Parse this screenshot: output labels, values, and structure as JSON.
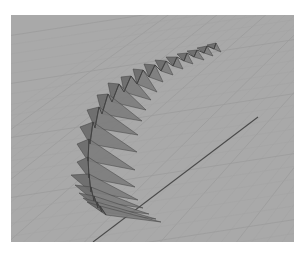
{
  "viewport": {
    "name": "perspective-viewport",
    "background": "#a9a9a9",
    "grid_color": "#9c9c9c",
    "grid_minor_color": "#a2a2a2",
    "axis_color": "#4a4a4a",
    "panel_left_fill": "#6b6b6b",
    "panel_right_fill": "#7c7c7c",
    "panel_edge": "#404040"
  },
  "axis_line": {
    "x1": 247,
    "y1": 102,
    "x2": 82,
    "y2": 227
  },
  "panels": [
    {
      "spine_top": [
        205,
        28
      ],
      "spine_bot": [
        203,
        34
      ],
      "left": [
        196,
        30
      ],
      "right": [
        210,
        37
      ]
    },
    {
      "spine_top": [
        196,
        31
      ],
      "spine_bot": [
        193,
        38
      ],
      "left": [
        186,
        33
      ],
      "right": [
        202,
        41
      ]
    },
    {
      "spine_top": [
        186,
        35
      ],
      "spine_bot": [
        183,
        42
      ],
      "left": [
        176,
        36
      ],
      "right": [
        193,
        45
      ]
    },
    {
      "spine_top": [
        176,
        38
      ],
      "spine_bot": [
        173,
        46
      ],
      "left": [
        166,
        39
      ],
      "right": [
        182,
        49
      ]
    },
    {
      "spine_top": [
        166,
        42
      ],
      "spine_bot": [
        162,
        51
      ],
      "left": [
        155,
        42
      ],
      "right": [
        172,
        54
      ]
    },
    {
      "spine_top": [
        155,
        46
      ],
      "spine_bot": [
        150,
        56
      ],
      "left": [
        144,
        45
      ],
      "right": [
        162,
        60
      ]
    },
    {
      "spine_top": [
        144,
        50
      ],
      "spine_bot": [
        138,
        62
      ],
      "left": [
        133,
        49
      ],
      "right": [
        152,
        67
      ]
    },
    {
      "spine_top": [
        132,
        55
      ],
      "spine_bot": [
        126,
        69
      ],
      "left": [
        122,
        54
      ],
      "right": [
        146,
        77
      ]
    },
    {
      "spine_top": [
        120,
        61
      ],
      "spine_bot": [
        113,
        77
      ],
      "left": [
        110,
        62
      ],
      "right": [
        140,
        85
      ]
    },
    {
      "spine_top": [
        108,
        69
      ],
      "spine_bot": [
        101,
        87
      ],
      "left": [
        97,
        68
      ],
      "right": [
        135,
        95
      ]
    },
    {
      "spine_top": [
        97,
        79
      ],
      "spine_bot": [
        91,
        99
      ],
      "left": [
        86,
        80
      ],
      "right": [
        131,
        106
      ]
    },
    {
      "spine_top": [
        88,
        92
      ],
      "spine_bot": [
        84,
        113
      ],
      "left": [
        76,
        95
      ],
      "right": [
        127,
        120
      ]
    },
    {
      "spine_top": [
        82,
        107
      ],
      "spine_bot": [
        79,
        129
      ],
      "left": [
        69,
        112
      ],
      "right": [
        126,
        137
      ]
    },
    {
      "spine_top": [
        78,
        124
      ],
      "spine_bot": [
        77,
        146
      ],
      "left": [
        66,
        129
      ],
      "right": [
        124,
        155
      ]
    },
    {
      "spine_top": [
        77,
        142
      ],
      "spine_bot": [
        78,
        163
      ],
      "left": [
        66,
        147
      ],
      "right": [
        124,
        172
      ]
    },
    {
      "spine_top": [
        78,
        159
      ],
      "spine_bot": [
        80,
        177
      ],
      "left": [
        60,
        160
      ],
      "right": [
        127,
        185
      ]
    },
    {
      "spine_top": [
        80,
        172
      ],
      "spine_bot": [
        83,
        186
      ],
      "left": [
        64,
        170
      ],
      "right": [
        132,
        193
      ]
    },
    {
      "spine_top": [
        83,
        181
      ],
      "spine_bot": [
        87,
        193
      ],
      "left": [
        68,
        178
      ],
      "right": [
        138,
        199
      ]
    },
    {
      "spine_top": [
        86,
        187
      ],
      "spine_bot": [
        91,
        197
      ],
      "left": [
        72,
        183
      ],
      "right": [
        145,
        204
      ]
    },
    {
      "spine_top": [
        89,
        191
      ],
      "spine_bot": [
        95,
        200
      ],
      "left": [
        76,
        187
      ],
      "right": [
        150,
        207
      ]
    }
  ]
}
